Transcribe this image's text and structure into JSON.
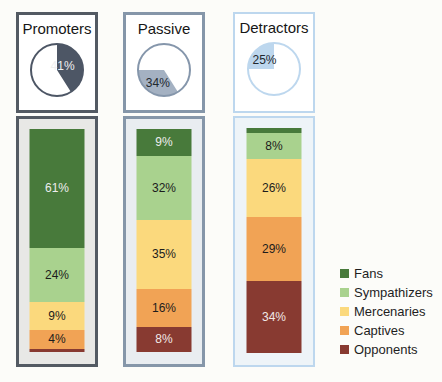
{
  "columns": [
    {
      "title": "Promoters",
      "border_color": "#535a63",
      "panel_fill": "#e8e8e6",
      "pie": {
        "label": "41%",
        "slice_start_pct": 0,
        "slice_end_pct": 41,
        "slice_color": "#4d5665",
        "outline_color": "#4d5665",
        "label_color": "#efefef"
      }
    },
    {
      "title": "Passive",
      "border_color": "#8596a9",
      "panel_fill": "#e9edf1",
      "pie": {
        "label": "34%",
        "slice_start_pct": 41,
        "slice_end_pct": 75,
        "slice_color": "#a4b1c2",
        "outline_color": "#8596ab",
        "label_color": "#22282e"
      }
    },
    {
      "title": "Detractors",
      "border_color": "#bdd7ee",
      "panel_fill": "#eef4f8",
      "pie": {
        "label": "25%",
        "slice_start_pct": 75,
        "slice_end_pct": 100,
        "slice_color": "#bdd7ee",
        "outline_color": "#bdd7ee",
        "label_color": "#22282e"
      }
    }
  ],
  "chart_data": {
    "type": "bar",
    "variant": "100% stacked columns with share-of-total pie insets",
    "groups": [
      "Promoters",
      "Passive",
      "Detractors"
    ],
    "group_share_pct": [
      41,
      34,
      25
    ],
    "series": [
      {
        "name": "Fans",
        "color": "#487a3b",
        "label_color": "#ededed",
        "values": [
          61,
          9,
          3
        ],
        "labels": [
          "61%",
          "9%",
          ""
        ]
      },
      {
        "name": "Sympathizers",
        "color": "#a9d28e",
        "label_color": "#1c1c1c",
        "values": [
          24,
          32,
          8
        ],
        "labels": [
          "24%",
          "32%",
          "8%"
        ]
      },
      {
        "name": "Mercenaries",
        "color": "#fbd97d",
        "label_color": "#1c1c1c",
        "values": [
          9,
          35,
          26
        ],
        "labels": [
          "9%",
          "35%",
          "26%"
        ]
      },
      {
        "name": "Captives",
        "color": "#f1a355",
        "label_color": "#1c1c1c",
        "values": [
          4,
          16,
          29
        ],
        "labels": [
          "4%",
          "16%",
          "29%"
        ]
      },
      {
        "name": "Opponents",
        "color": "#883a31",
        "label_color": "#f0e8e6",
        "values": [
          2,
          8,
          34
        ],
        "labels": [
          "",
          "8%",
          "34%"
        ]
      }
    ],
    "ylim": [
      0,
      100
    ],
    "grid": false,
    "legend_position": "right"
  },
  "legend": {
    "items": [
      {
        "label": "Fans"
      },
      {
        "label": "Sympathizers"
      },
      {
        "label": "Mercenaries"
      },
      {
        "label": "Captives"
      },
      {
        "label": "Opponents"
      }
    ]
  }
}
